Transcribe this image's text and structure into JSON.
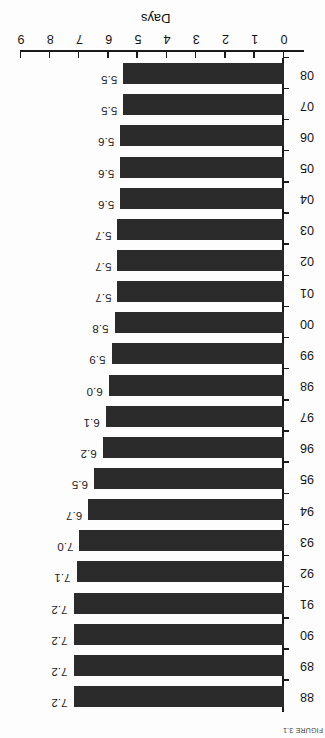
{
  "figure": {
    "orientation_note": "rotated-180",
    "caption": "FIGURE 3.1",
    "axis_color": "#1a1a1a",
    "bar_color": "#2b2b2b",
    "background": "#fdfdfd"
  },
  "chart_data": {
    "type": "bar",
    "title": "",
    "subtitle": "",
    "orientation": "horizontal",
    "xlabel": "",
    "ylabel": "Days",
    "ylim": [
      0,
      9
    ],
    "yticks": [
      "0",
      "1",
      "2",
      "3",
      "4",
      "5",
      "6",
      "7",
      "8",
      "9"
    ],
    "grid": false,
    "legend": null,
    "categories": [
      "88",
      "89",
      "90",
      "91",
      "92",
      "93",
      "94",
      "95",
      "96",
      "97",
      "98",
      "99",
      "00",
      "01",
      "02",
      "03",
      "04",
      "05",
      "06",
      "07",
      "08"
    ],
    "values": [
      7.2,
      7.2,
      7.2,
      7.2,
      7.1,
      7.0,
      6.7,
      6.5,
      6.2,
      6.1,
      6.0,
      5.9,
      5.8,
      5.7,
      5.7,
      5.7,
      5.6,
      5.6,
      5.6,
      5.5,
      5.5
    ],
    "data_labels": [
      "7.2",
      "7.2",
      "7.2",
      "7.2",
      "7.1",
      "7.0",
      "6.7",
      "6.5",
      "6.2",
      "6.1",
      "6.0",
      "5.9",
      "5.8",
      "5.7",
      "5.7",
      "5.7",
      "5.6",
      "5.6",
      "5.6",
      "5.5",
      "5.5"
    ]
  }
}
